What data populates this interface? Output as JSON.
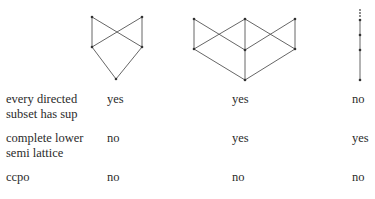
{
  "diagrams": [
    {
      "name": "poset-1",
      "points": [
        [
          92,
          17
        ],
        [
          142,
          17
        ],
        [
          92,
          47
        ],
        [
          142,
          47
        ],
        [
          116,
          79
        ]
      ],
      "edges": [
        [
          0,
          2
        ],
        [
          1,
          3
        ],
        [
          0,
          3
        ],
        [
          1,
          2
        ],
        [
          2,
          4
        ],
        [
          3,
          4
        ]
      ]
    },
    {
      "name": "poset-2",
      "points": [
        [
          194,
          19
        ],
        [
          245,
          19
        ],
        [
          295,
          19
        ],
        [
          194,
          49
        ],
        [
          245,
          50
        ],
        [
          295,
          49
        ],
        [
          245,
          80
        ]
      ],
      "edges": [
        [
          0,
          3
        ],
        [
          0,
          4
        ],
        [
          1,
          3
        ],
        [
          1,
          4
        ],
        [
          1,
          5
        ],
        [
          2,
          4
        ],
        [
          2,
          5
        ],
        [
          3,
          6
        ],
        [
          4,
          6
        ],
        [
          5,
          6
        ]
      ]
    },
    {
      "name": "chain",
      "points": [
        [
          360,
          20
        ],
        [
          360,
          35
        ],
        [
          360,
          50
        ],
        [
          360,
          80
        ]
      ],
      "edges": [
        [
          0,
          1
        ],
        [
          1,
          2
        ],
        [
          2,
          3
        ]
      ],
      "dotted_top": {
        "x": 360,
        "y1": 10,
        "y2": 17
      }
    }
  ],
  "stroke_color": "#555555",
  "rows": [
    {
      "label_line1": "every directed",
      "label_line2": "subset has sup",
      "values": [
        "yes",
        "yes",
        "no"
      ]
    },
    {
      "label_line1": "complete lower",
      "label_line2": "semi lattice",
      "values": [
        "no",
        "yes",
        "yes"
      ]
    },
    {
      "label_line1": "ccpo",
      "label_line2": "",
      "values": [
        "no",
        "no",
        "no"
      ]
    }
  ]
}
